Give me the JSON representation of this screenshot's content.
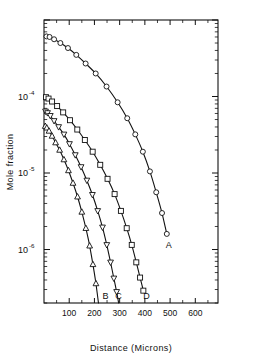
{
  "chart_data": {
    "type": "line",
    "title": "",
    "xlabel": "Distance (Microns)",
    "ylabel": "Mole fraction",
    "xlim": [
      0,
      690
    ],
    "ylim": [
      2e-07,
      0.001
    ],
    "xscale": "linear",
    "yscale": "log",
    "grid": false,
    "legend": "inline-curve-labels",
    "xticks": [
      100,
      200,
      300,
      400,
      500,
      600
    ],
    "xticklabels": [
      "100",
      "200",
      "300",
      "400",
      "500",
      "600"
    ],
    "yticks": [
      0.0001,
      1e-05,
      1e-06
    ],
    "yticklabels": [
      "10⁻⁴",
      "10⁻⁵",
      "10⁻⁶"
    ],
    "ytick_mantissa": "10",
    "ytick_exponents": [
      "-4",
      "-5",
      "-6"
    ],
    "series": [
      {
        "name": "A",
        "label": "A",
        "marker": "circle",
        "x": [
          10,
          22,
          40,
          65,
          95,
          128,
          165,
          205,
          248,
          292,
          330,
          362,
          392,
          420,
          445,
          468,
          487
        ],
        "y": [
          0.00061,
          0.0006,
          0.00056,
          0.0005,
          0.00043,
          0.00035,
          0.00027,
          0.0002,
          0.000135,
          8.4e-05,
          5.2e-05,
          3.2e-05,
          1.9e-05,
          1.05e-05,
          5.6e-06,
          3e-06,
          1.6e-06
        ]
      },
      {
        "name": "D",
        "label": "D",
        "marker": "square",
        "x": [
          8,
          18,
          32,
          52,
          76,
          103,
          132,
          162,
          193,
          223,
          252,
          280,
          305,
          328,
          348,
          366,
          381,
          394
        ],
        "y": [
          9.8e-05,
          9.4e-05,
          8.6e-05,
          7.5e-05,
          6.2e-05,
          4.9e-05,
          3.7e-05,
          2.7e-05,
          1.9e-05,
          1.28e-05,
          8.4e-06,
          5.3e-06,
          3.2e-06,
          1.9e-06,
          1.15e-06,
          6.8e-07,
          4.3e-07,
          2.9e-07
        ]
      },
      {
        "name": "C",
        "label": "C",
        "marker": "triangle-down",
        "x": [
          6,
          14,
          25,
          40,
          58,
          79,
          101,
          124,
          147,
          170,
          192,
          213,
          232,
          249,
          264,
          277,
          288,
          296
        ],
        "y": [
          6.4e-05,
          6.1e-05,
          5.6e-05,
          4.8e-05,
          4e-05,
          3.2e-05,
          2.4e-05,
          1.72e-05,
          1.2e-05,
          8e-06,
          5.2e-06,
          3.2e-06,
          1.95e-06,
          1.15e-06,
          6.8e-07,
          4.2e-07,
          2.8e-07,
          2e-07
        ]
      },
      {
        "name": "B",
        "label": "B",
        "marker": "triangle-up",
        "x": [
          5,
          11,
          20,
          32,
          46,
          62,
          79,
          97,
          115,
          133,
          150,
          166,
          181,
          194,
          206,
          216,
          224,
          230
        ],
        "y": [
          4.1e-05,
          3.9e-05,
          3.55e-05,
          3.05e-05,
          2.5e-05,
          2e-05,
          1.5e-05,
          1.08e-05,
          7.4e-06,
          4.9e-06,
          3.1e-06,
          1.9e-06,
          1.12e-06,
          6.4e-07,
          3.6e-07,
          2e-07,
          1.1e-07,
          6.5e-08
        ]
      }
    ]
  }
}
